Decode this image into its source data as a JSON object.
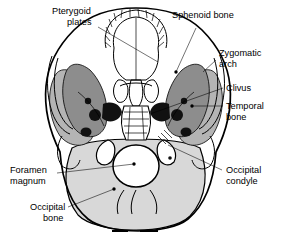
{
  "figure": {
    "view": "basal (inferior) view of cranium"
  },
  "palette": {
    "background": "#ffffff",
    "ink": "#000000",
    "occipital_bone": "#d8d8d8",
    "sphenoid_bone": "#8d8d8d",
    "temporal_bone": "#b4b4b4",
    "foramina_dark": "#111111",
    "bone_white": "#ffffff"
  },
  "labels": [
    {
      "id": "pterygoid-plates",
      "text": "Pterygoid\nplates",
      "line1": "Pterygoid",
      "line2": "plates",
      "side": "left",
      "x": 52,
      "y": 14
    },
    {
      "id": "sphenoid-bone",
      "text": "Sphenoid bone",
      "line1": "Sphenoid bone",
      "line2": "",
      "side": "right",
      "x": 172,
      "y": 18
    },
    {
      "id": "zygomatic-arch",
      "text": "Zygomatic\narch",
      "line1": "Zygomatic",
      "line2": "arch",
      "side": "right",
      "x": 219,
      "y": 56
    },
    {
      "id": "clivus",
      "text": "Clivus",
      "line1": "Clivus",
      "line2": "",
      "side": "right",
      "x": 226,
      "y": 88
    },
    {
      "id": "temporal-bone",
      "text": "Temporal\nbone",
      "line1": "Temporal",
      "line2": "bone",
      "side": "right",
      "x": 226,
      "y": 107
    },
    {
      "id": "occipital-condyle",
      "text": "Occipital\ncondyle",
      "line1": "Occipital",
      "line2": "condyle",
      "side": "right",
      "x": 226,
      "y": 170
    },
    {
      "id": "foramen-magnum",
      "text": "Foramen\nmagnum",
      "line1": "Foramen",
      "line2": "magnum",
      "side": "left",
      "x": 10,
      "y": 170
    },
    {
      "id": "occipital-bone",
      "text": "Occipital\nbone",
      "line1": "Occipital",
      "line2": "bone",
      "side": "left",
      "x": 30,
      "y": 207
    }
  ],
  "structures": [
    {
      "id": "maxillary-dental-arch",
      "name": "Maxillary teeth / dental arch"
    },
    {
      "id": "hard-palate",
      "name": "Hard palate"
    },
    {
      "id": "vomer",
      "name": "Vomer"
    },
    {
      "id": "foramen-magnum",
      "name": "Foramen magnum"
    },
    {
      "id": "occipital-condyle",
      "name": "Occipital condyle"
    },
    {
      "id": "clivus",
      "name": "Clivus"
    },
    {
      "id": "zygomatic-arch",
      "name": "Zygomatic arch"
    },
    {
      "id": "mastoid-process",
      "name": "Mastoid process"
    },
    {
      "id": "carotid-canal",
      "name": "Carotid canal"
    },
    {
      "id": "jugular-foramen",
      "name": "Jugular foramen"
    }
  ]
}
